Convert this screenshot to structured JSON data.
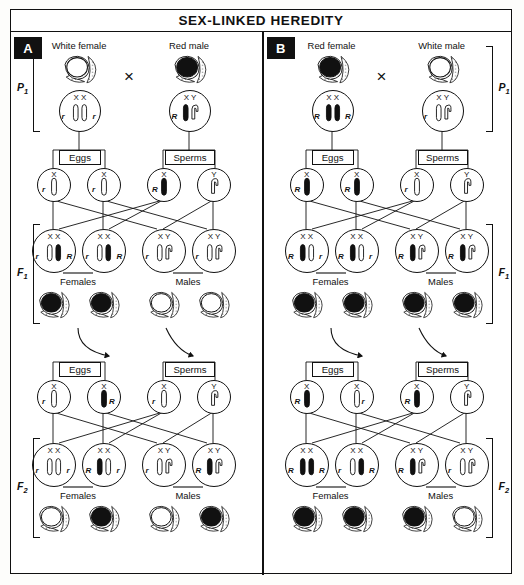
{
  "title": "SEX-LINKED HEREDITY",
  "colors": {
    "ink": "#111111",
    "paper": "#ffffff",
    "badge_bg": "#111111",
    "badge_fg": "#ffffff"
  },
  "gamete_box_labels": {
    "eggs": "Eggs",
    "sperms": "Sperms"
  },
  "sex_labels": {
    "females": "Females",
    "males": "Males"
  },
  "cross_symbol": "×",
  "generation_labels": {
    "p1": "P",
    "p1_sub": "1",
    "f1": "F",
    "f1_sub": "1",
    "f2": "F",
    "f2_sub": "2"
  },
  "panels": [
    {
      "id": "A",
      "badge": "A",
      "parents": [
        {
          "label": "White female",
          "sex": "female",
          "chromosomes": "X X",
          "alleles": [
            "r",
            "r"
          ],
          "phenotype": "white"
        },
        {
          "label": "Red male",
          "sex": "male",
          "chromosomes": "X Y",
          "alleles": [
            "R",
            ""
          ],
          "phenotype": "red"
        }
      ],
      "gametes_1": {
        "eggs": [
          {
            "chromosome": "X",
            "allele": "r",
            "allele_side": "left"
          },
          {
            "chromosome": "X",
            "allele": "r",
            "allele_side": "left"
          }
        ],
        "sperms": [
          {
            "chromosome": "X",
            "allele": "R",
            "allele_side": "left",
            "filled": true
          },
          {
            "chromosome": "Y",
            "allele": "",
            "allele_side": "left"
          }
        ]
      },
      "f1": [
        {
          "chromosomes": "X X",
          "alleles": [
            "r",
            "R"
          ],
          "sex": "female",
          "phenotype": "red"
        },
        {
          "chromosomes": "X X",
          "alleles": [
            "r",
            "R"
          ],
          "sex": "female",
          "phenotype": "red"
        },
        {
          "chromosomes": "X Y",
          "alleles": [
            "r",
            ""
          ],
          "sex": "male",
          "phenotype": "white"
        },
        {
          "chromosomes": "X Y",
          "alleles": [
            "r",
            ""
          ],
          "sex": "male",
          "phenotype": "white"
        }
      ],
      "gametes_2": {
        "eggs": [
          {
            "chromosome": "X",
            "allele": "r",
            "allele_side": "left"
          },
          {
            "chromosome": "X",
            "allele": "R",
            "allele_side": "right",
            "filled": true
          }
        ],
        "sperms": [
          {
            "chromosome": "X",
            "allele": "r",
            "allele_side": "left"
          },
          {
            "chromosome": "Y",
            "allele": "",
            "allele_side": "left"
          }
        ]
      },
      "f2": [
        {
          "chromosomes": "X X",
          "alleles": [
            "r",
            "r"
          ],
          "sex": "female",
          "phenotype": "white"
        },
        {
          "chromosomes": "X X",
          "alleles": [
            "R",
            "r"
          ],
          "sex": "female",
          "phenotype": "red"
        },
        {
          "chromosomes": "X Y",
          "alleles": [
            "r",
            ""
          ],
          "sex": "male",
          "phenotype": "white"
        },
        {
          "chromosomes": "X Y",
          "alleles": [
            "R",
            ""
          ],
          "sex": "male",
          "phenotype": "red"
        }
      ]
    },
    {
      "id": "B",
      "badge": "B",
      "parents": [
        {
          "label": "Red female",
          "sex": "female",
          "chromosomes": "X X",
          "alleles": [
            "R",
            "R"
          ],
          "phenotype": "red"
        },
        {
          "label": "White male",
          "sex": "male",
          "chromosomes": "X Y",
          "alleles": [
            "r",
            ""
          ],
          "phenotype": "white"
        }
      ],
      "gametes_1": {
        "eggs": [
          {
            "chromosome": "X",
            "allele": "R",
            "allele_side": "left",
            "filled": true
          },
          {
            "chromosome": "X",
            "allele": "R",
            "allele_side": "left",
            "filled": true
          }
        ],
        "sperms": [
          {
            "chromosome": "X",
            "allele": "r",
            "allele_side": "left"
          },
          {
            "chromosome": "Y",
            "allele": "",
            "allele_side": "left"
          }
        ]
      },
      "f1": [
        {
          "chromosomes": "X X",
          "alleles": [
            "R",
            "r"
          ],
          "sex": "female",
          "phenotype": "red"
        },
        {
          "chromosomes": "X X",
          "alleles": [
            "R",
            "r"
          ],
          "sex": "female",
          "phenotype": "red"
        },
        {
          "chromosomes": "X Y",
          "alleles": [
            "R",
            ""
          ],
          "sex": "male",
          "phenotype": "red"
        },
        {
          "chromosomes": "X Y",
          "alleles": [
            "R",
            ""
          ],
          "sex": "male",
          "phenotype": "red"
        }
      ],
      "gametes_2": {
        "eggs": [
          {
            "chromosome": "X",
            "allele": "R",
            "allele_side": "left",
            "filled": true
          },
          {
            "chromosome": "X",
            "allele": "r",
            "allele_side": "right"
          }
        ],
        "sperms": [
          {
            "chromosome": "X",
            "allele": "R",
            "allele_side": "left",
            "filled": true
          },
          {
            "chromosome": "Y",
            "allele": "",
            "allele_side": "left"
          }
        ]
      },
      "f2": [
        {
          "chromosomes": "X X",
          "alleles": [
            "R",
            "R"
          ],
          "sex": "female",
          "phenotype": "red"
        },
        {
          "chromosomes": "X X",
          "alleles": [
            "r",
            "R"
          ],
          "sex": "female",
          "phenotype": "red"
        },
        {
          "chromosomes": "X Y",
          "alleles": [
            "R",
            ""
          ],
          "sex": "male",
          "phenotype": "red"
        },
        {
          "chromosomes": "X Y",
          "alleles": [
            "r",
            ""
          ],
          "sex": "male",
          "phenotype": "white"
        }
      ]
    }
  ]
}
